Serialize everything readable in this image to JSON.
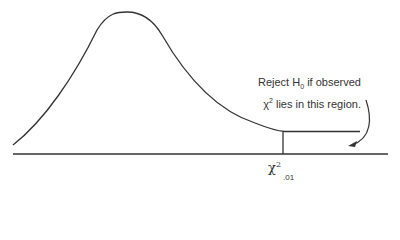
{
  "diagram": {
    "annotation": {
      "line1_prefix": "Reject H",
      "line1_sub": "0",
      "line1_suffix": " if observed",
      "line2_symbol": "χ",
      "line2_sup": "2",
      "line2_suffix": " lies in this region."
    },
    "critical_value": {
      "symbol": "χ",
      "sup": "2",
      "sub": ".01"
    },
    "colors": {
      "stroke": "#333333",
      "background": "#ffffff"
    }
  }
}
